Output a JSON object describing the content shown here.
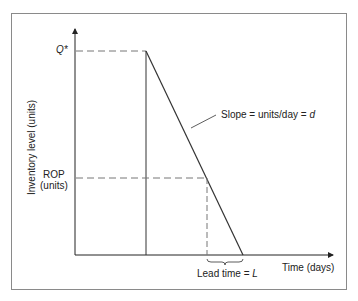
{
  "diagram": {
    "title_cropped": "",
    "y_axis_label": "Inventory level (units)",
    "x_axis_label": "Time (days)",
    "q_star_label": "Q*",
    "rop_label_line1": "ROP",
    "rop_label_line2": "(units)",
    "slope_label_prefix": "Slope = units/day = ",
    "slope_symbol": "d",
    "lead_time_prefix": "Lead time = ",
    "lead_time_symbol": "L"
  },
  "colors": {
    "line": "#333333",
    "dashed": "#777777",
    "frame": "#8a8a8a"
  }
}
